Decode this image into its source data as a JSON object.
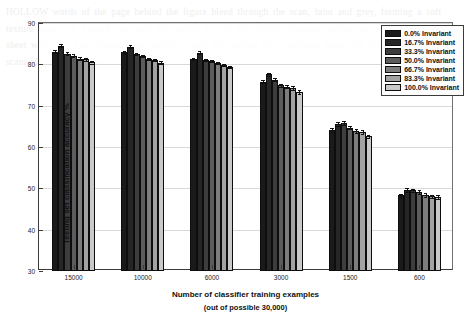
{
  "chart_data": {
    "type": "bar",
    "title": "",
    "xlabel": "Number of classifier training examples",
    "xlabel_sub": "(out of possible 30,000)",
    "ylabel": "Testing set classification accuracy %",
    "ylim": [
      30,
      90
    ],
    "yticks": [
      30,
      40,
      50,
      60,
      70,
      80,
      90
    ],
    "ytick_labels": [
      "30",
      "40",
      "50",
      "60",
      "70",
      "80",
      "90"
    ],
    "grid": true,
    "legend_position": "top-right",
    "categories": [
      "15000",
      "10000",
      "6000",
      "3000",
      "1500",
      "600"
    ],
    "series": [
      {
        "name": "0.0% Invariant",
        "color": "#1a1a1a",
        "values": [
          83.1,
          82.9,
          81.3,
          75.8,
          64.1,
          48.3
        ],
        "errors": [
          0.35,
          0.3,
          0.3,
          0.4,
          0.4,
          0.4
        ]
      },
      {
        "name": "16.7% Invariant",
        "color": "#262626",
        "values": [
          84.5,
          84.3,
          82.8,
          77.6,
          65.6,
          49.6
        ],
        "errors": [
          0.3,
          0.3,
          0.35,
          0.4,
          0.4,
          0.4
        ]
      },
      {
        "name": "33.3% Invariant",
        "color": "#3d3d3d",
        "values": [
          82.6,
          82.5,
          81.1,
          76.3,
          65.8,
          49.5
        ],
        "errors": [
          0.3,
          0.3,
          0.3,
          0.4,
          0.4,
          0.4
        ]
      },
      {
        "name": "50.0% Invariant",
        "color": "#5c5c5c",
        "values": [
          82.1,
          82.0,
          80.8,
          74.9,
          64.7,
          49.1
        ],
        "errors": [
          0.3,
          0.3,
          0.3,
          0.4,
          0.4,
          0.4
        ]
      },
      {
        "name": "66.7% Invariant",
        "color": "#7d7d7d",
        "values": [
          81.4,
          81.3,
          80.3,
          74.6,
          63.9,
          48.4
        ],
        "errors": [
          0.3,
          0.3,
          0.3,
          0.4,
          0.4,
          0.4
        ]
      },
      {
        "name": "83.3% Invariant",
        "color": "#a3a3a3",
        "values": [
          81.2,
          81.0,
          79.9,
          74.3,
          63.6,
          48.1
        ],
        "errors": [
          0.35,
          0.3,
          0.3,
          0.4,
          0.4,
          0.4
        ]
      },
      {
        "name": "100.0% Invariant",
        "color": "#c9c9c9",
        "values": [
          80.5,
          80.4,
          79.3,
          73.3,
          62.6,
          47.9
        ],
        "errors": [
          0.3,
          0.3,
          0.3,
          0.4,
          0.4,
          0.4
        ]
      }
    ]
  },
  "background_text": "HOLLOW words of the page behind the figure bleed through the scan, faint and grey, forming a soft texture under the plotted axes and the legend box of this figure, repeating across the width of the printed sheet while the bars remain crisp above it, and the caption line continues along the lower margin of the scanned document page."
}
